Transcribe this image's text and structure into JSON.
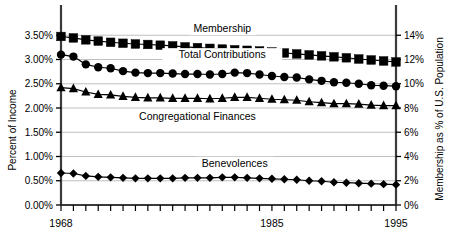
{
  "chart_data": {
    "type": "line",
    "title": "",
    "xlabel": "",
    "ylabel": "Percent of Income",
    "y2label": "Membership as % of U.S. Population",
    "grid": true,
    "legend_position": "inline-annotations",
    "xlim": [
      1968,
      1995
    ],
    "ylim": [
      0.0,
      4.0
    ],
    "y2lim": [
      0,
      16
    ],
    "x": [
      1968,
      1969,
      1970,
      1971,
      1972,
      1973,
      1974,
      1975,
      1976,
      1977,
      1978,
      1979,
      1980,
      1981,
      1982,
      1983,
      1984,
      1985,
      1986,
      1987,
      1988,
      1989,
      1990,
      1991,
      1992,
      1993,
      1994,
      1995
    ],
    "xticklabels": [
      "1968",
      "1985",
      "1995"
    ],
    "xticklabel_values": [
      1968,
      1985,
      1995
    ],
    "yticklabels": [
      "0.00%",
      "0.50%",
      "1.00%",
      "1.50%",
      "2.00%",
      "2.50%",
      "3.00%",
      "3.50%"
    ],
    "ytickvalues": [
      0.0,
      0.5,
      1.0,
      1.5,
      2.0,
      2.5,
      3.0,
      3.5
    ],
    "y2ticklabels": [
      "0%",
      "2%",
      "4%",
      "6%",
      "8%",
      "10%",
      "12%",
      "14%"
    ],
    "y2tickvalues": [
      0,
      2,
      4,
      6,
      8,
      10,
      12,
      14
    ],
    "series": [
      {
        "name": "Membership",
        "axis": "right",
        "marker": "square",
        "color": "#000000",
        "label_x": 1981.0,
        "label_y": 14.55,
        "values": [
          13.9,
          13.78,
          13.62,
          13.52,
          13.42,
          13.34,
          13.28,
          13.24,
          13.18,
          13.12,
          13.04,
          12.98,
          12.92,
          12.86,
          12.8,
          12.76,
          12.7,
          12.62,
          12.54,
          12.46,
          12.38,
          12.3,
          12.22,
          12.14,
          12.04,
          11.96,
          11.88,
          11.8
        ]
      },
      {
        "name": "Total Contributions",
        "axis": "left",
        "marker": "circle",
        "color": "#000000",
        "label_x": 1981.0,
        "label_y": 3.1,
        "values": [
          3.1,
          3.06,
          2.9,
          2.84,
          2.82,
          2.76,
          2.73,
          2.72,
          2.72,
          2.71,
          2.7,
          2.7,
          2.69,
          2.7,
          2.73,
          2.72,
          2.69,
          2.66,
          2.64,
          2.63,
          2.59,
          2.56,
          2.53,
          2.52,
          2.5,
          2.47,
          2.46,
          2.45
        ]
      },
      {
        "name": "Congregational Finances",
        "axis": "left",
        "marker": "triangle",
        "color": "#000000",
        "label_x": 1979.0,
        "label_y": 1.82,
        "values": [
          2.42,
          2.4,
          2.33,
          2.28,
          2.27,
          2.24,
          2.22,
          2.21,
          2.21,
          2.2,
          2.2,
          2.2,
          2.19,
          2.2,
          2.22,
          2.22,
          2.2,
          2.18,
          2.17,
          2.16,
          2.13,
          2.11,
          2.09,
          2.09,
          2.08,
          2.06,
          2.05,
          2.05
        ]
      },
      {
        "name": "Benevolences",
        "axis": "left",
        "marker": "diamond",
        "color": "#000000",
        "label_x": 1982.0,
        "label_y": 0.86,
        "values": [
          0.66,
          0.65,
          0.6,
          0.58,
          0.57,
          0.56,
          0.55,
          0.55,
          0.55,
          0.55,
          0.56,
          0.56,
          0.56,
          0.57,
          0.57,
          0.56,
          0.55,
          0.54,
          0.53,
          0.52,
          0.5,
          0.49,
          0.47,
          0.46,
          0.45,
          0.44,
          0.43,
          0.42
        ]
      }
    ]
  },
  "colors": {
    "ink": "#000000",
    "grid": "#b8b8b8",
    "axis": "#3a3a3a",
    "background": "#ffffff"
  }
}
